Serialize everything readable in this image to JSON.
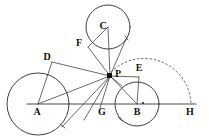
{
  "figure": {
    "width": 209,
    "height": 140,
    "background_color": "#ffffff",
    "ink_color": "#2b2b2b",
    "dashed_color": "#555555"
  },
  "labels": {
    "A": "A",
    "B": "B",
    "C": "C",
    "D": "D",
    "E": "E",
    "F": "F",
    "G": "G",
    "H": "H",
    "P": "P"
  },
  "points": {
    "A": {
      "x": 38,
      "y": 104,
      "label_x": 37,
      "label_y": 112,
      "marker": "none"
    },
    "B": {
      "x": 137,
      "y": 104,
      "label_x": 137,
      "label_y": 112,
      "marker": "dot-small"
    },
    "C": {
      "x": 108,
      "y": 27,
      "label_x": 103,
      "label_y": 26,
      "marker": "none"
    },
    "D": {
      "x": 52,
      "y": 62,
      "label_x": 47,
      "label_y": 57,
      "marker": "none"
    },
    "E": {
      "x": 139,
      "y": 77,
      "label_x": 139,
      "label_y": 68,
      "marker": "none"
    },
    "F": {
      "x": 88,
      "y": 47,
      "label_x": 79,
      "label_y": 43,
      "marker": "none"
    },
    "G": {
      "x": 103,
      "y": 104,
      "label_x": 102,
      "label_y": 112,
      "marker": "none"
    },
    "H": {
      "x": 191,
      "y": 104,
      "label_x": 190,
      "label_y": 112,
      "marker": "none"
    },
    "P": {
      "x": 110,
      "y": 76,
      "label_x": 118,
      "label_y": 74,
      "marker": "dot-large"
    }
  },
  "circles": [
    {
      "name": "circle-A",
      "cx": 38,
      "cy": 104,
      "r": 31
    },
    {
      "name": "circle-B",
      "cx": 137,
      "cy": 104,
      "r": 22
    },
    {
      "name": "circle-C",
      "cx": 108,
      "cy": 27,
      "r": 22
    }
  ],
  "dashed_arc": {
    "name": "dashed-arc-PH",
    "description": "large dashed arc from near P sweeping right and down to H",
    "start_x": 112,
    "start_y": 73,
    "end_x": 191,
    "end_y": 104,
    "radius": 47
  },
  "baseline": {
    "name": "baseline-AGBH",
    "from_x": 27,
    "from_y": 104,
    "to_x": 196,
    "to_y": 104
  },
  "segments": [
    {
      "name": "segment-P-D",
      "x1": 110,
      "y1": 76,
      "x2": 52,
      "y2": 62
    },
    {
      "name": "segment-P-A",
      "x1": 110,
      "y1": 76,
      "x2": 38,
      "y2": 104
    },
    {
      "name": "segment-A-D",
      "x1": 38,
      "y1": 104,
      "x2": 52,
      "y2": 62
    },
    {
      "name": "segment-P-tangent-A",
      "x1": 110,
      "y1": 76,
      "x2": 62,
      "y2": 127
    },
    {
      "name": "segment-P-F",
      "x1": 110,
      "y1": 76,
      "x2": 88,
      "y2": 47
    },
    {
      "name": "segment-P-tangent-C",
      "x1": 110,
      "y1": 76,
      "x2": 126,
      "y2": 39
    },
    {
      "name": "segment-C-F",
      "x1": 108,
      "y1": 27,
      "x2": 88,
      "y2": 47
    },
    {
      "name": "segment-C-P",
      "x1": 108,
      "y1": 27,
      "x2": 110,
      "y2": 76
    },
    {
      "name": "segment-P-E",
      "x1": 110,
      "y1": 76,
      "x2": 139,
      "y2": 77
    },
    {
      "name": "segment-P-B",
      "x1": 110,
      "y1": 76,
      "x2": 137,
      "y2": 104
    },
    {
      "name": "segment-E-B",
      "x1": 139,
      "y1": 77,
      "x2": 137,
      "y2": 104
    },
    {
      "name": "segment-P-G",
      "x1": 110,
      "y1": 76,
      "x2": 100,
      "y2": 107
    },
    {
      "name": "segment-P-down-left",
      "x1": 110,
      "y1": 76,
      "x2": 84,
      "y2": 120
    },
    {
      "name": "segment-P-H",
      "x1": 110,
      "y1": 76,
      "x2": 120,
      "y2": 84
    }
  ],
  "arrow_marks": [
    {
      "name": "arrow-on-circle-A-lower",
      "x": 63,
      "y": 126
    },
    {
      "name": "arrow-on-circle-C-right",
      "x": 127,
      "y": 38
    },
    {
      "name": "arrow-on-circle-B-lower-left",
      "x": 120,
      "y": 119
    }
  ]
}
